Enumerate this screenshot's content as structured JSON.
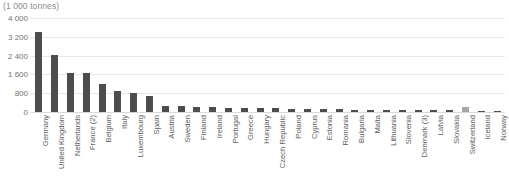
{
  "chart_data": {
    "type": "bar",
    "title": "(1 000 tonnes)",
    "xlabel": "",
    "ylabel": "",
    "ylim": [
      0,
      4000
    ],
    "yticks": [
      0,
      800,
      1600,
      2400,
      3200,
      4000
    ],
    "ytick_labels": [
      "0",
      "800",
      "1 600",
      "2 400",
      "3 200",
      "4 000"
    ],
    "grid": true,
    "legend": "none",
    "bar_color": "#4d4d4d",
    "highlight_color": "#a6a6a6",
    "highlight_categories": [
      "Switzerland"
    ],
    "categories": [
      "Germany",
      "United Kingdom",
      "Netherlands",
      "France (2)",
      "Belgium",
      "Italy",
      "Luxembourg",
      "Spain",
      "Austria",
      "Sweden",
      "Finland",
      "Ireland",
      "Portugal",
      "Greece",
      "Hungary",
      "Czech Republic",
      "Poland",
      "Cyprus",
      "Estonia",
      "Romania",
      "Bulgaria",
      "Malta",
      "Lithuania",
      "Slovenia",
      "Denmark (3)",
      "Latvia",
      "Slovakia",
      "Switzerland",
      "Iceland",
      "Norway"
    ],
    "values": [
      3400,
      2420,
      1680,
      1680,
      1200,
      880,
      800,
      700,
      260,
      240,
      220,
      200,
      190,
      180,
      160,
      150,
      140,
      130,
      120,
      110,
      100,
      95,
      90,
      85,
      80,
      75,
      70,
      230,
      60,
      20
    ]
  }
}
